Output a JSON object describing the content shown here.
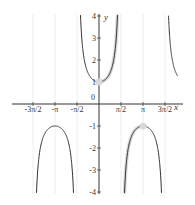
{
  "chart_data": {
    "type": "line",
    "title": "",
    "function": "y = sec(x)",
    "xlabel": "x",
    "ylabel": "y",
    "xlim": [
      -4.9,
      5.6
    ],
    "ylim": [
      -4,
      4
    ],
    "grid": {
      "vertical_at_multiples_of_half_pi": true
    },
    "x_ticks": [
      {
        "value": -4.712389,
        "label": "-3π/2"
      },
      {
        "value": -3.141593,
        "label": "-π"
      },
      {
        "value": -1.570796,
        "label": "-π/2"
      },
      {
        "value": 1.570796,
        "label": "π/2"
      },
      {
        "value": 3.141593,
        "label": "π"
      },
      {
        "value": 4.712389,
        "label": "3π/2"
      }
    ],
    "y_ticks": [
      {
        "value": 4,
        "label": "4"
      },
      {
        "value": 3,
        "label": "3"
      },
      {
        "value": 2,
        "label": "2"
      },
      {
        "value": 1,
        "label": "1"
      },
      {
        "value": 0,
        "label": "0"
      },
      {
        "value": -1,
        "label": "-1"
      },
      {
        "value": -2,
        "label": "-2"
      },
      {
        "value": -3,
        "label": "-3"
      },
      {
        "value": -4,
        "label": "-4"
      }
    ],
    "series": [
      {
        "name": "sec(x) branches",
        "color": "#333333",
        "width": 1,
        "branches": [
          [
            -4.9,
            -4.712389
          ],
          [
            -4.712389,
            -1.570796
          ],
          [
            -1.570796,
            1.570796
          ],
          [
            1.570796,
            4.712389
          ],
          [
            4.712389,
            5.6
          ]
        ]
      },
      {
        "name": "highlighted sec(x) on [0, π]",
        "color": "#d9d9d9",
        "width": 3.5,
        "branches": [
          [
            0,
            1.570796
          ],
          [
            1.570796,
            3.141593
          ]
        ]
      }
    ],
    "highlighted_points": [
      {
        "x": 0,
        "y": 1,
        "color": "#d9d9d9"
      },
      {
        "x": 3.141593,
        "y": -1,
        "color": "#d9d9d9"
      }
    ]
  },
  "axes": {
    "x_label": "x",
    "y_label": "y",
    "origin_label": "0"
  }
}
